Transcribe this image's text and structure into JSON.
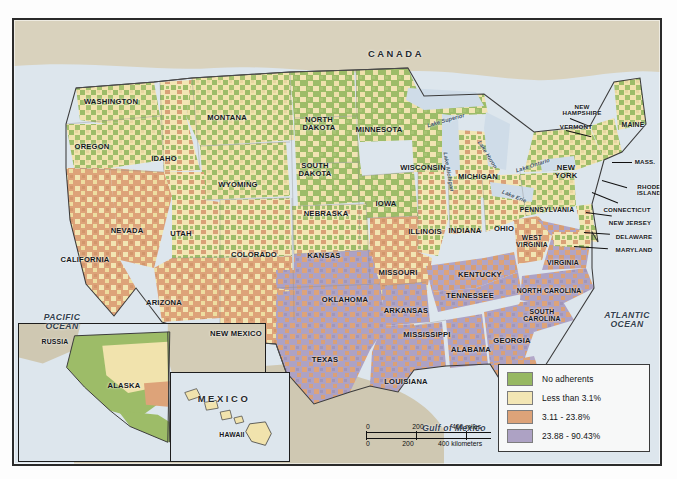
{
  "map": {
    "title": "United States county-level adherents choropleth map",
    "countries": [
      {
        "name": "CANADA",
        "x": 382,
        "y": 34
      },
      {
        "name": "MEXICO",
        "x": 210,
        "y": 379
      }
    ],
    "oceans": [
      {
        "name": "PACIFIC\nOCEAN",
        "line1": "PACIFIC",
        "line2": "OCEAN",
        "x": 48,
        "y": 302
      },
      {
        "name": "ATLANTIC\nOCEAN",
        "line1": "ATLANTIC",
        "line2": "OCEAN",
        "x": 613,
        "y": 300
      }
    ],
    "gulf": {
      "label": "Gulf of Mexico",
      "x": 440,
      "y": 408
    },
    "lakes": [
      {
        "name": "Lake Superior",
        "x": 432,
        "y": 101,
        "rot": -16
      },
      {
        "name": "Lake Michigan",
        "x": 434,
        "y": 152,
        "rot": 80
      },
      {
        "name": "Lake Huron",
        "x": 473,
        "y": 135,
        "rot": 58
      },
      {
        "name": "Lake Erie",
        "x": 500,
        "y": 177,
        "rot": 22
      },
      {
        "name": "Lake Ontario",
        "x": 519,
        "y": 146,
        "rot": -18
      }
    ],
    "states": [
      {
        "name": "WASHINGTON",
        "x": 97,
        "y": 82
      },
      {
        "name": "OREGON",
        "x": 78,
        "y": 127
      },
      {
        "name": "IDAHO",
        "x": 150,
        "y": 139
      },
      {
        "name": "MONTANA",
        "x": 213,
        "y": 98
      },
      {
        "name": "NORTH\nDAKOTA",
        "line1": "NORTH",
        "line2": "DAKOTA",
        "x": 305,
        "y": 104
      },
      {
        "name": "SOUTH\nDAKOTA",
        "line1": "SOUTH",
        "line2": "DAKOTA",
        "x": 301,
        "y": 150
      },
      {
        "name": "MINNESOTA",
        "x": 365,
        "y": 110
      },
      {
        "name": "WISCONSIN",
        "x": 409,
        "y": 148
      },
      {
        "name": "MICHIGAN",
        "x": 464,
        "y": 157
      },
      {
        "name": "WYOMING",
        "x": 224,
        "y": 165
      },
      {
        "name": "NEBRASKA",
        "x": 312,
        "y": 194
      },
      {
        "name": "IOWA",
        "x": 372,
        "y": 184
      },
      {
        "name": "ILLINOIS",
        "x": 411,
        "y": 212
      },
      {
        "name": "INDIANA",
        "x": 451,
        "y": 211
      },
      {
        "name": "OHIO",
        "x": 490,
        "y": 209
      },
      {
        "name": "NEVADA",
        "x": 113,
        "y": 211
      },
      {
        "name": "UTAH",
        "x": 167,
        "y": 214
      },
      {
        "name": "COLORADO",
        "x": 240,
        "y": 235
      },
      {
        "name": "KANSAS",
        "x": 310,
        "y": 236
      },
      {
        "name": "MISSOURI",
        "x": 384,
        "y": 253
      },
      {
        "name": "KENTUCKY",
        "x": 466,
        "y": 255
      },
      {
        "name": "WEST\nVIRGINIA",
        "line1": "WEST",
        "line2": "VIRGINIA",
        "x": 518,
        "y": 222
      },
      {
        "name": "VIRGINIA",
        "x": 549,
        "y": 243
      },
      {
        "name": "CALIFORNIA",
        "x": 71,
        "y": 240
      },
      {
        "name": "ARIZONA",
        "x": 150,
        "y": 283
      },
      {
        "name": "NEW MEXICO",
        "x": 222,
        "y": 314
      },
      {
        "name": "OKLAHOMA",
        "x": 331,
        "y": 280
      },
      {
        "name": "ARKANSAS",
        "x": 392,
        "y": 291
      },
      {
        "name": "TENNESSEE",
        "x": 456,
        "y": 276
      },
      {
        "name": "NORTH CAROLINA",
        "x": 535,
        "y": 271
      },
      {
        "name": "SOUTH\nCAROLINA",
        "line1": "SOUTH",
        "line2": "CAROLINA",
        "x": 528,
        "y": 296
      },
      {
        "name": "TEXAS",
        "x": 311,
        "y": 340
      },
      {
        "name": "MISSISSIPPI",
        "x": 413,
        "y": 315
      },
      {
        "name": "ALABAMA",
        "x": 457,
        "y": 330
      },
      {
        "name": "GEORGIA",
        "x": 498,
        "y": 321
      },
      {
        "name": "LOUISIANA",
        "x": 392,
        "y": 362
      },
      {
        "name": "FLORIDA",
        "x": 504,
        "y": 381
      }
    ],
    "northeast": [
      {
        "name": "NEW\nHAMPSHIRE",
        "line1": "NEW",
        "line2": "HAMPSHIRE",
        "x": 568,
        "y": 90
      },
      {
        "name": "VERMONT",
        "x": 562,
        "y": 106
      },
      {
        "name": "MAINE",
        "x": 619,
        "y": 105
      },
      {
        "name": "NEW\nYORK",
        "line1": "NEW",
        "line2": "YORK",
        "x": 552,
        "y": 152
      },
      {
        "name": "MASS.",
        "x": 631,
        "y": 142
      },
      {
        "name": "RHODE\nISLAND",
        "line1": "RHODE",
        "line2": "ISLAND",
        "x": 635,
        "y": 170
      },
      {
        "name": "CONNECTICUT",
        "x": 613,
        "y": 190
      },
      {
        "name": "PENNSYLVANIA",
        "x": 533,
        "y": 190
      },
      {
        "name": "NEW JERSEY",
        "x": 616,
        "y": 203
      },
      {
        "name": "DELAWARE",
        "x": 620,
        "y": 217
      },
      {
        "name": "MARYLAND",
        "x": 620,
        "y": 230
      }
    ],
    "insets": {
      "alaska": {
        "name": "alaska-inset",
        "labels": [
          {
            "name": "RUSSIA",
            "x": 36,
            "y": 18
          },
          {
            "name": "ALASKA",
            "x": 105,
            "y": 62
          },
          {
            "name": "CANADA",
            "x": 185,
            "y": 83
          }
        ]
      },
      "hawaii": {
        "name": "hawaii-inset",
        "labels": [
          {
            "name": "HAWAII",
            "x": 61,
            "y": 62
          }
        ]
      }
    }
  },
  "legend": {
    "name": "map-legend",
    "items": [
      {
        "label": "No adherents",
        "color": "#97b862"
      },
      {
        "label": "Less than 3.1%",
        "color": "#f3e6b4"
      },
      {
        "label": "3.11 - 23.8%",
        "color": "#dda379"
      },
      {
        "label": "23.88 - 90.43%",
        "color": "#ada2c4"
      }
    ]
  },
  "scalebar": {
    "name": "scale-bar",
    "miles": {
      "ticks": [
        "0",
        "200",
        "400 miles"
      ],
      "unit": "miles"
    },
    "kilometers": {
      "ticks": [
        "0",
        "200",
        "400 kilometers"
      ],
      "unit": "kilometers"
    }
  },
  "colors": {
    "no_adherents": "#97b862",
    "low": "#f3e6b4",
    "medium": "#dda379",
    "high": "#ada2c4",
    "water": "#dde6ed",
    "land_foreign": "#d9d2bd",
    "border": "#2b2b2b"
  }
}
